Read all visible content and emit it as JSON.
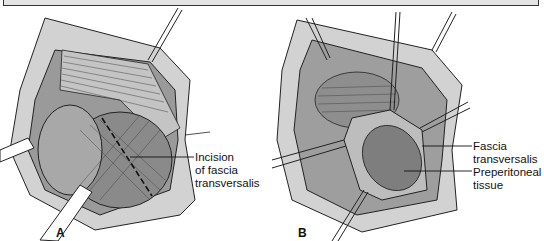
{
  "figure": {
    "panels": [
      {
        "id": "A",
        "label": "A",
        "annotations": [
          {
            "line1": "Incision",
            "line2": "of fascia",
            "line3": "transversalis"
          }
        ]
      },
      {
        "id": "B",
        "label": "B",
        "annotations": [
          {
            "line1": "Fascia",
            "line2": "transversalis"
          },
          {
            "line1": "Preperitoneal",
            "line2": "tissue"
          }
        ]
      }
    ],
    "colors": {
      "caption_box": "#e4e4e4",
      "tissue_dark": "#8c8c8c",
      "tissue_mid": "#b0b0b0",
      "tissue_light": "#d6d6d6",
      "skin": "#cfcfcf",
      "line": "#222222"
    }
  }
}
